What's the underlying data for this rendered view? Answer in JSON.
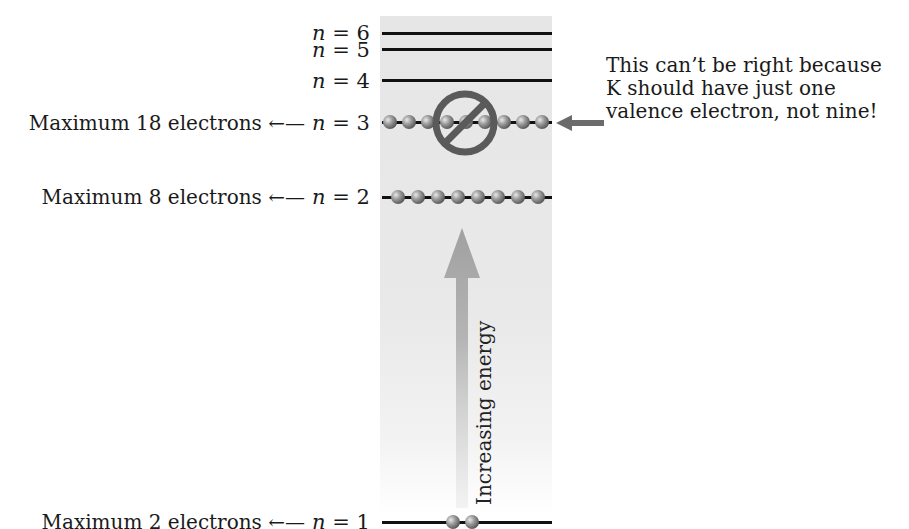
{
  "diagram": {
    "levels": [
      {
        "n": "6",
        "label": "n = 6",
        "y": 33,
        "electrons": 0
      },
      {
        "n": "5",
        "label": "n = 5",
        "y": 49,
        "electrons": 0
      },
      {
        "n": "4",
        "label": "n = 4",
        "y": 80,
        "electrons": 0
      },
      {
        "n": "3",
        "label": "n = 3",
        "y": 122,
        "electrons": 9,
        "max": "Maximum 18 electrons"
      },
      {
        "n": "2",
        "label": "n = 2",
        "y": 197,
        "electrons": 8,
        "max": "Maximum 8 electrons"
      },
      {
        "n": "1",
        "label": "n = 1",
        "y": 522,
        "electrons": 2,
        "max": "Maximum 2 electrons"
      }
    ],
    "arrow_left": "←",
    "energy_axis_label": "Increasing energy",
    "prohibition_symbol": "no-sign-icon",
    "note_lines": [
      "This can’t be right because",
      "K should have just one",
      "valence electron, not nine!"
    ],
    "colors": {
      "column_bg": "#e6e6e6",
      "line": "#111111",
      "electron": "#777777",
      "prohibit": "#595959",
      "energy_arrow": "#a8a8a8",
      "pointer_arrow": "#6b6b6b"
    }
  }
}
